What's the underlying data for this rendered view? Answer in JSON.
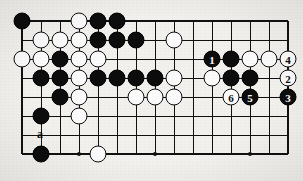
{
  "diagram": {
    "type": "go-board-problem",
    "board": {
      "columns": 15,
      "rows": 8,
      "origin_x": 22,
      "origin_y": 21,
      "spacing": 19,
      "line_color": "#111111",
      "background_color": "#f2f1ee",
      "star_points": [
        {
          "col": 3,
          "row": 7
        },
        {
          "col": 7,
          "row": 3
        },
        {
          "col": 7,
          "row": 7
        },
        {
          "col": 12,
          "row": 7
        }
      ]
    },
    "stones": [
      {
        "col": 0,
        "row": 0,
        "color": "black",
        "label": ""
      },
      {
        "col": 3,
        "row": 0,
        "color": "white",
        "label": ""
      },
      {
        "col": 4,
        "row": 0,
        "color": "black",
        "label": ""
      },
      {
        "col": 5,
        "row": 0,
        "color": "black",
        "label": ""
      },
      {
        "col": 1,
        "row": 1,
        "color": "white",
        "label": ""
      },
      {
        "col": 2,
        "row": 1,
        "color": "white",
        "label": ""
      },
      {
        "col": 3,
        "row": 1,
        "color": "white",
        "label": ""
      },
      {
        "col": 4,
        "row": 1,
        "color": "black",
        "label": ""
      },
      {
        "col": 5,
        "row": 1,
        "color": "black",
        "label": ""
      },
      {
        "col": 6,
        "row": 1,
        "color": "black",
        "label": ""
      },
      {
        "col": 8,
        "row": 1,
        "color": "white",
        "label": ""
      },
      {
        "col": 0,
        "row": 2,
        "color": "white",
        "label": ""
      },
      {
        "col": 1,
        "row": 2,
        "color": "white",
        "label": ""
      },
      {
        "col": 2,
        "row": 2,
        "color": "black",
        "label": ""
      },
      {
        "col": 3,
        "row": 2,
        "color": "white",
        "label": ""
      },
      {
        "col": 4,
        "row": 2,
        "color": "white",
        "label": ""
      },
      {
        "col": 10,
        "row": 2,
        "color": "black",
        "label": "1"
      },
      {
        "col": 11,
        "row": 2,
        "color": "black",
        "label": ""
      },
      {
        "col": 12,
        "row": 2,
        "color": "white",
        "label": ""
      },
      {
        "col": 13,
        "row": 2,
        "color": "white",
        "label": ""
      },
      {
        "col": 14,
        "row": 2,
        "color": "white",
        "label": "4"
      },
      {
        "col": 1,
        "row": 3,
        "color": "black",
        "label": ""
      },
      {
        "col": 2,
        "row": 3,
        "color": "black",
        "label": ""
      },
      {
        "col": 3,
        "row": 3,
        "color": "white",
        "label": ""
      },
      {
        "col": 4,
        "row": 3,
        "color": "black",
        "label": ""
      },
      {
        "col": 5,
        "row": 3,
        "color": "black",
        "label": ""
      },
      {
        "col": 6,
        "row": 3,
        "color": "black",
        "label": ""
      },
      {
        "col": 7,
        "row": 3,
        "color": "black",
        "label": ""
      },
      {
        "col": 8,
        "row": 3,
        "color": "white",
        "label": ""
      },
      {
        "col": 10,
        "row": 3,
        "color": "white",
        "label": ""
      },
      {
        "col": 11,
        "row": 3,
        "color": "black",
        "label": ""
      },
      {
        "col": 12,
        "row": 3,
        "color": "black",
        "label": ""
      },
      {
        "col": 14,
        "row": 3,
        "color": "white",
        "label": "2"
      },
      {
        "col": 2,
        "row": 4,
        "color": "black",
        "label": ""
      },
      {
        "col": 3,
        "row": 4,
        "color": "white",
        "label": ""
      },
      {
        "col": 6,
        "row": 4,
        "color": "white",
        "label": ""
      },
      {
        "col": 7,
        "row": 4,
        "color": "white",
        "label": ""
      },
      {
        "col": 8,
        "row": 4,
        "color": "white",
        "label": ""
      },
      {
        "col": 11,
        "row": 4,
        "color": "white",
        "label": "6"
      },
      {
        "col": 12,
        "row": 4,
        "color": "black",
        "label": "5"
      },
      {
        "col": 14,
        "row": 4,
        "color": "black",
        "label": "3"
      },
      {
        "col": 1,
        "row": 5,
        "color": "black",
        "label": ""
      },
      {
        "col": 3,
        "row": 5,
        "color": "white",
        "label": ""
      },
      {
        "col": 1,
        "row": 7,
        "color": "black",
        "label": ""
      },
      {
        "col": 4,
        "row": 7,
        "color": "white",
        "label": ""
      }
    ],
    "markers": [
      {
        "col": 1,
        "row": 6,
        "text": "a"
      }
    ],
    "move_sequence": [
      {
        "number": "1",
        "color": "black"
      },
      {
        "number": "2",
        "color": "white"
      },
      {
        "number": "3",
        "color": "black"
      },
      {
        "number": "4",
        "color": "white"
      },
      {
        "number": "5",
        "color": "black"
      },
      {
        "number": "6",
        "color": "white"
      }
    ]
  }
}
